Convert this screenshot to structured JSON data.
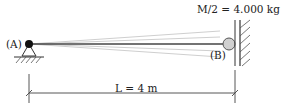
{
  "diagram": {
    "type": "cantilever-string-mass",
    "labels": {
      "mass": "M/2 = 4.000 kg",
      "point_a": "(A)",
      "point_b": "(B)",
      "length": "L = 4 m"
    },
    "colors": {
      "line": "#333333",
      "faint_line": "#c8c8c8",
      "mass_fill": "#d0d0d0",
      "pin": "#111111"
    }
  }
}
